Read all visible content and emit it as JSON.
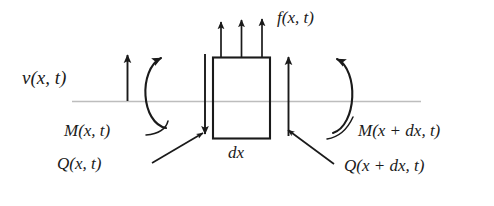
{
  "figure": {
    "type": "free-body-diagram",
    "background_color": "#ffffff",
    "stroke_color": "#1a1a1a",
    "reference_line_color": "#b9b9b9",
    "labels": {
      "transverse_displacement": "v(x, t)",
      "distributed_load": "f(x, t)",
      "element_length": "dx",
      "moment_left": "M(x, t)",
      "shear_left": "Q(x, t)",
      "moment_right": "M(x + dx, t)",
      "shear_right": "Q(x + dx, t)"
    },
    "elements": [
      {
        "name": "reference-axis-line",
        "kind": "line"
      },
      {
        "name": "v-arrow",
        "kind": "arrow",
        "direction": "up"
      },
      {
        "name": "moment-arc-left",
        "kind": "curved-arrow",
        "direction": "counterclockwise"
      },
      {
        "name": "moment-arc-right",
        "kind": "curved-arrow",
        "direction": "clockwise"
      },
      {
        "name": "shear-arrow-left",
        "kind": "arrow",
        "direction": "down"
      },
      {
        "name": "shear-arrow-right",
        "kind": "arrow",
        "direction": "up"
      },
      {
        "name": "load-arrow-1",
        "kind": "arrow",
        "direction": "up"
      },
      {
        "name": "load-arrow-2",
        "kind": "arrow",
        "direction": "up"
      },
      {
        "name": "load-arrow-3",
        "kind": "arrow",
        "direction": "up"
      },
      {
        "name": "beam-element-box",
        "kind": "rectangle"
      },
      {
        "name": "leader-line-q-left",
        "kind": "leader-arrow"
      },
      {
        "name": "leader-line-q-right",
        "kind": "leader-arrow"
      },
      {
        "name": "leader-line-m-left",
        "kind": "leader-curve"
      },
      {
        "name": "leader-line-m-right",
        "kind": "leader-curve"
      }
    ]
  }
}
